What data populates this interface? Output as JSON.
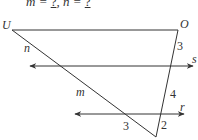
{
  "prompt": {
    "m_label": "m = ",
    "m_blank": "?",
    "separator": ", ",
    "n_label": "n = ",
    "n_blank": "?"
  },
  "diagram": {
    "points": {
      "U": "U",
      "O": "O"
    },
    "lines": {
      "n": "n",
      "m": "m",
      "s": "s",
      "r": "r"
    },
    "angles": {
      "angle_top_right": "3",
      "angle_mid_right": "4",
      "angle_bottom_left": "3",
      "angle_bottom_right": "2"
    },
    "stroke_color": "#333333"
  }
}
